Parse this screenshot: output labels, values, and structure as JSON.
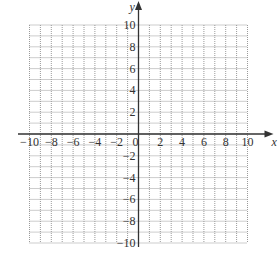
{
  "chart_data": {
    "type": "coordinate-grid",
    "title": "",
    "xlabel": "x",
    "ylabel": "y",
    "xlim": [
      -10,
      10
    ],
    "ylim": [
      -10,
      10
    ],
    "grid": true,
    "grid_step": 1,
    "grid_style": "dotted",
    "x_tick_labels": [
      "-10",
      "-8",
      "-6",
      "-4",
      "-2",
      "0",
      "2",
      "4",
      "6",
      "8",
      "10"
    ],
    "y_tick_labels": [
      "10",
      "8",
      "6",
      "4",
      "2",
      "-2",
      "-4",
      "-6",
      "-8",
      "-10"
    ],
    "series": []
  },
  "colors": {
    "axis": "#333333",
    "grid": "#9a9a9a",
    "text": "#333333",
    "background": "#ffffff"
  },
  "layout": {
    "origin_x": 138.5,
    "origin_y": 134,
    "unit": 10.9
  }
}
